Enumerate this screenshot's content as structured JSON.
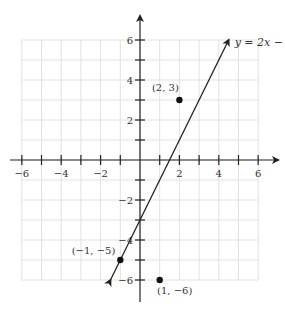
{
  "chart_data": {
    "type": "scatter",
    "title": "",
    "xlabel": "",
    "ylabel": "",
    "xlim": [
      -6,
      6
    ],
    "ylim": [
      -6,
      6
    ],
    "grid": true,
    "x_ticks": [
      -6,
      -5,
      -4,
      -3,
      -2,
      -1,
      1,
      2,
      3,
      4,
      5,
      6
    ],
    "x_tick_labels": [
      {
        "value": -6,
        "label": "−6"
      },
      {
        "value": -4,
        "label": "−4"
      },
      {
        "value": -2,
        "label": "−2"
      },
      {
        "value": 2,
        "label": "2"
      },
      {
        "value": 4,
        "label": "4"
      },
      {
        "value": 6,
        "label": "6"
      }
    ],
    "y_ticks": [
      -6,
      -5,
      -4,
      -3,
      -2,
      -1,
      1,
      2,
      3,
      4,
      5,
      6
    ],
    "y_tick_labels": [
      {
        "value": 6,
        "label": "6"
      },
      {
        "value": 4,
        "label": "4"
      },
      {
        "value": 2,
        "label": "2"
      },
      {
        "value": -2,
        "label": "−2"
      },
      {
        "value": -4,
        "label": "−4"
      },
      {
        "value": -6,
        "label": "−6"
      }
    ],
    "lines": [
      {
        "name": "y = 2x − 3",
        "label": "y = 2x − 3",
        "slope": 2,
        "intercept": -3,
        "x_range": [
          -1.5,
          4.5
        ],
        "arrows": "both"
      }
    ],
    "points": [
      {
        "x": 2,
        "y": 3,
        "label": "(2, 3)"
      },
      {
        "x": -1,
        "y": -5,
        "label": "(−1, −5)"
      },
      {
        "x": 1,
        "y": -6,
        "label": "(1, −6)"
      }
    ],
    "colors": {
      "axis": "#222222",
      "grid": "#e2e2e2",
      "line": "#222222",
      "point": "#111111"
    }
  }
}
